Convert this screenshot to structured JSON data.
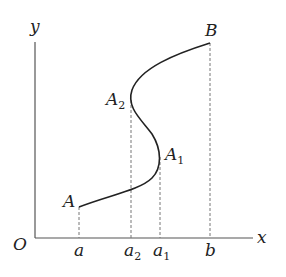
{
  "axes": {
    "x_label": "x",
    "y_label": "y",
    "origin_label": "O"
  },
  "points": [
    {
      "name": "A",
      "base": "A",
      "sub": "",
      "x": 79,
      "y": 207
    },
    {
      "name": "A1",
      "base": "A",
      "sub": "1",
      "x": 160,
      "y": 157
    },
    {
      "name": "A2",
      "base": "A",
      "sub": "2",
      "x": 131,
      "y": 96
    },
    {
      "name": "B",
      "base": "B",
      "sub": "",
      "x": 210,
      "y": 43
    }
  ],
  "ticks": [
    {
      "base": "a",
      "sub": "",
      "x": 79
    },
    {
      "base": "a",
      "sub": "2",
      "x": 131
    },
    {
      "base": "a",
      "sub": "1",
      "x": 160
    },
    {
      "base": "b",
      "sub": "",
      "x": 210
    }
  ],
  "colors": {
    "curve": "#222222",
    "axis": "#555555",
    "dashed": "#777777"
  }
}
